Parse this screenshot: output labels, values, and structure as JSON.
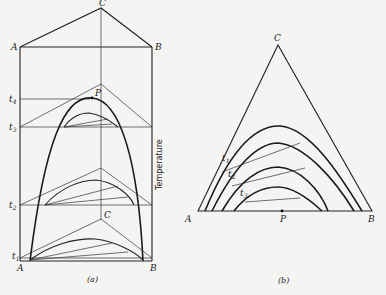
{
  "figure_a": {
    "vertex_top": "C",
    "vertex_left": "A",
    "vertex_right": "B",
    "point": "P",
    "inner_vertex": "C",
    "bottom_left": "A",
    "bottom_right": "B",
    "isotherms": [
      "t4",
      "t3",
      "t2",
      "t1"
    ],
    "t4_main": "t",
    "t4_sub": "4",
    "t3_main": "t",
    "t3_sub": "3",
    "t2_main": "t",
    "t2_sub": "2",
    "t1_main": "t",
    "t1_sub": "1",
    "axis_label": "Temperature",
    "caption": "(a)"
  },
  "figure_b": {
    "vertex_top": "C",
    "vertex_left": "A",
    "vertex_right": "B",
    "point": "P",
    "t1_main": "t",
    "t1_sub": "1",
    "t2_main": "t",
    "t2_sub": "2",
    "t3_main": "t",
    "t3_sub": "3",
    "caption": "(b)"
  }
}
